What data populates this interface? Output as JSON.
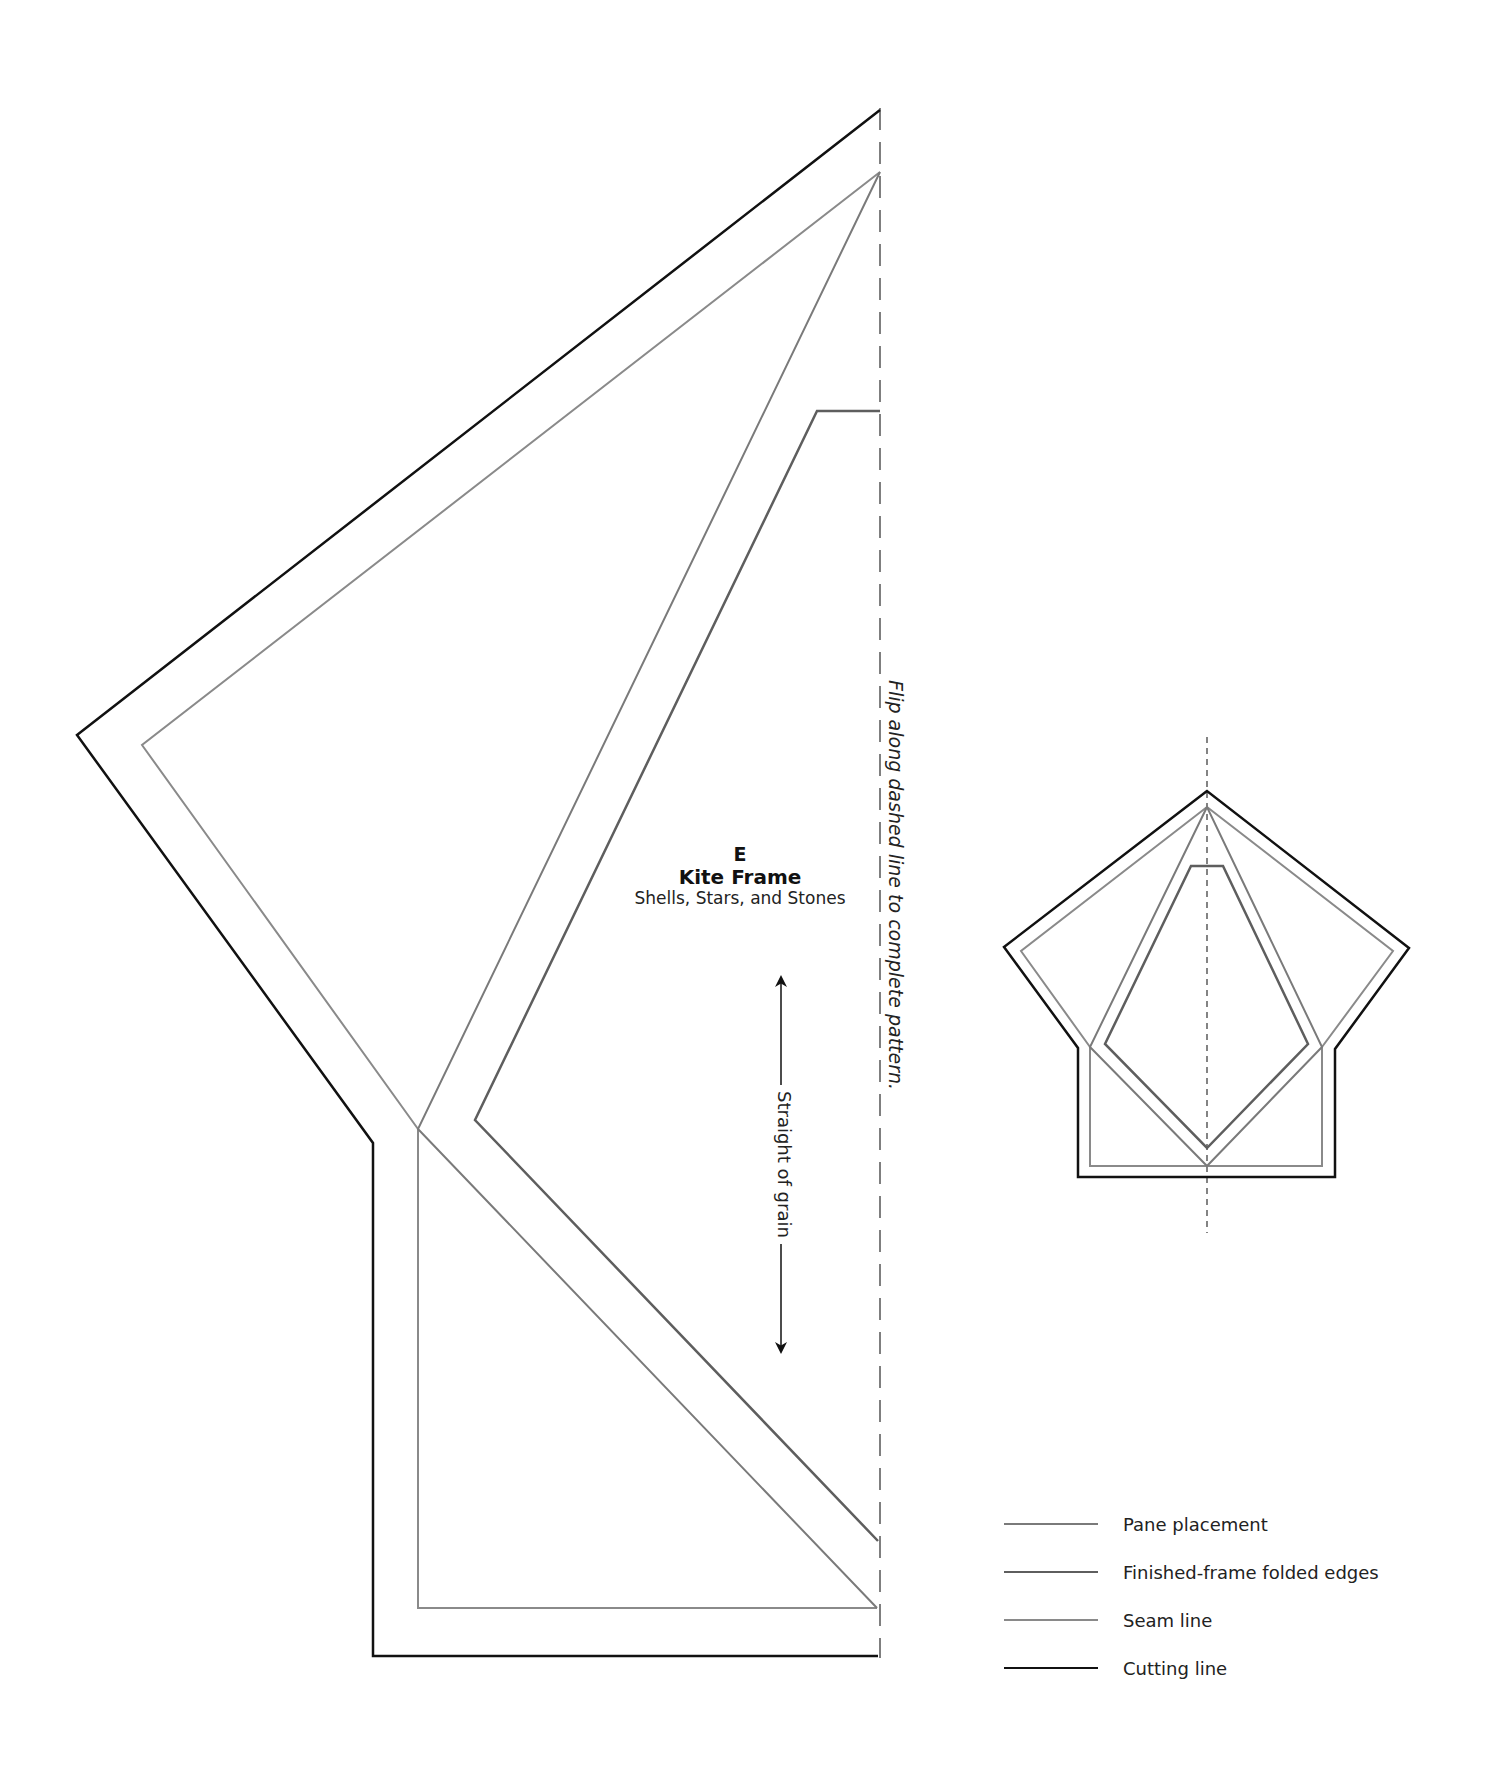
{
  "template": {
    "letter": "E",
    "name": "Kite Frame",
    "project": "Shells, Stars, and Stones"
  },
  "notes": {
    "flip": "Flip along dashed line to complete pattern.",
    "grain": "Straight of grain"
  },
  "legend": {
    "items": [
      {
        "label": "Pane placement",
        "color": "#7a7a7a",
        "width": 2
      },
      {
        "label": "Finished-frame folded edges",
        "color": "#5e5e5e",
        "width": 2.5
      },
      {
        "label": "Seam line",
        "color": "#8a8a8a",
        "width": 2
      },
      {
        "label": "Cutting line",
        "color": "#111111",
        "width": 2.5
      }
    ]
  },
  "colors": {
    "cutting": "#111111",
    "seam": "#8a8a8a",
    "finished": "#5e5e5e",
    "pane": "#7a7a7a",
    "fold": "#555555"
  },
  "diagram": {
    "main": {
      "fold_line": {
        "x": 880,
        "y1": 108,
        "y2": 1658
      },
      "cutting_line": [
        [
          880,
          110
        ],
        [
          77,
          735
        ],
        [
          373,
          1143
        ],
        [
          373,
          1656
        ],
        [
          878,
          1656
        ]
      ],
      "seam_line": [
        [
          880,
          172
        ],
        [
          142,
          745
        ],
        [
          418,
          1129
        ],
        [
          418,
          1608
        ],
        [
          877,
          1608
        ]
      ],
      "pane_placement": [
        [
          880,
          172
        ],
        [
          418,
          1129
        ],
        [
          877,
          1608
        ]
      ],
      "finished_frame": [
        [
          880,
          411
        ],
        [
          817,
          411
        ],
        [
          475,
          1120
        ],
        [
          878,
          1541
        ]
      ],
      "grain_arrow": {
        "x": 781,
        "y1": 973,
        "y2": 1356
      }
    },
    "thumbnail": {
      "axis": {
        "x": 1207,
        "y1": 737,
        "y2": 1233
      },
      "cutting_line": [
        [
          1207,
          791
        ],
        [
          1004,
          947
        ],
        [
          1078,
          1048
        ],
        [
          1078,
          1177
        ],
        [
          1335,
          1177
        ],
        [
          1335,
          1049
        ],
        [
          1409,
          948
        ]
      ],
      "seam_line": [
        [
          1207,
          807
        ],
        [
          1021,
          951
        ],
        [
          1090,
          1047
        ],
        [
          1090,
          1166
        ],
        [
          1322,
          1166
        ],
        [
          1322,
          1047
        ],
        [
          1393,
          951
        ]
      ],
      "pane_placement": [
        [
          1207,
          807
        ],
        [
          1090,
          1047
        ],
        [
          1207,
          1166
        ],
        [
          1322,
          1047
        ]
      ],
      "finished_frame": [
        [
          1191,
          866
        ],
        [
          1223,
          866
        ],
        [
          1308,
          1044
        ],
        [
          1207,
          1148
        ],
        [
          1105,
          1044
        ]
      ]
    }
  }
}
